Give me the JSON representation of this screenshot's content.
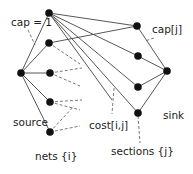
{
  "diagram": {
    "type": "flow-network",
    "labels": {
      "cap_one": "cap = 1",
      "cap_j": "cap[j]",
      "source": "source",
      "sink": "sink",
      "cost": "cost[i,j]",
      "nets": "nets {i}",
      "sections": "sections {j}"
    },
    "colors": {
      "edge": "#444444",
      "node": "#111111",
      "dashed": "#555555"
    },
    "nodes": {
      "source": [
        21,
        73
      ],
      "nets": [
        [
          49,
          13
        ],
        [
          49,
          43
        ],
        [
          50,
          73
        ],
        [
          50,
          102
        ],
        [
          50,
          132
        ]
      ],
      "sections": [
        [
          137,
          26
        ],
        [
          138,
          56
        ],
        [
          138,
          87
        ],
        [
          138,
          113
        ]
      ],
      "sink": [
        167,
        71
      ]
    }
  }
}
